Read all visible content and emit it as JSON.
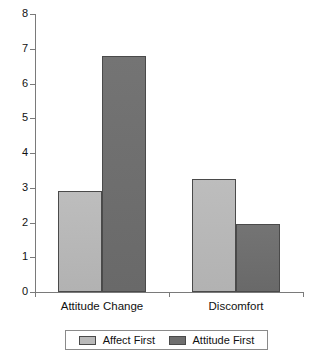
{
  "chart_data": {
    "type": "bar",
    "title": "",
    "subtitle": "",
    "xlabel": "",
    "ylabel": "",
    "categories": [
      "Attitude Change",
      "Discomfort"
    ],
    "series": [
      {
        "name": "Affect First",
        "color": "#b9b9b9",
        "values": [
          2.9,
          3.25
        ]
      },
      {
        "name": "Attitude First",
        "color": "#6f6f6f",
        "values": [
          6.8,
          1.95
        ]
      }
    ],
    "ylim": [
      0,
      8
    ],
    "y_ticks": [
      0,
      1,
      2,
      3,
      4,
      5,
      6,
      7,
      8
    ],
    "y_tick_labels": [
      "0",
      "1",
      "2",
      "3",
      "4",
      "5",
      "6",
      "7",
      "8"
    ],
    "grid": false,
    "legend_position": "bottom",
    "axis_color": "#7a7a7a",
    "bar_border_color": "#4a4a4a"
  },
  "legend": {
    "entries": [
      {
        "label": "Affect First"
      },
      {
        "label": "Attitude First"
      }
    ]
  }
}
